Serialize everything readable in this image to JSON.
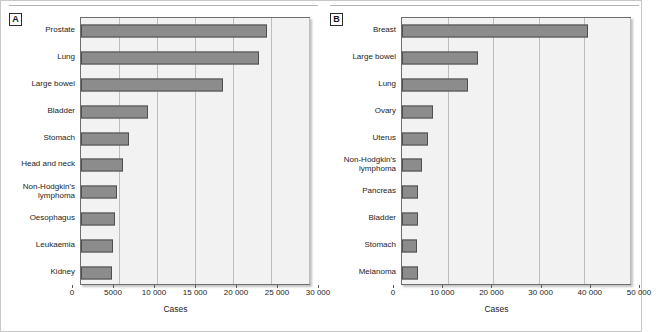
{
  "figure": {
    "background": "#ffffff",
    "bar_color": "#8c8c8c",
    "bar_edge_color": "#4f4f4f",
    "plot_background": "#f2f2f2",
    "gridline_color": "#bdbdbd"
  },
  "panels": [
    {
      "tag": "A",
      "axis_title": "Cases"
    },
    {
      "tag": "B",
      "axis_title": "Cases"
    }
  ],
  "chart_data": [
    {
      "type": "bar",
      "title": "A",
      "orientation": "horizontal",
      "xlabel": "Cases",
      "ylabel": "",
      "xlim": [
        0,
        30000
      ],
      "grid": true,
      "legend": "none",
      "xticks": [
        0,
        5000,
        10000,
        15000,
        20000,
        25000,
        30000
      ],
      "xticklabels": [
        "0",
        "5000",
        "10 000",
        "15 000",
        "20 000",
        "25 000",
        "30 000"
      ],
      "categories": [
        "Prostate",
        "Lung",
        "Large bowel",
        "Bladder",
        "Stomach",
        "Head and neck",
        "Non-Hodgkin's\nlymphoma",
        "Oesophagus",
        "Leukaemia",
        "Kidney"
      ],
      "values": [
        24500,
        23400,
        18700,
        8800,
        6300,
        5500,
        4800,
        4500,
        4200,
        4100
      ]
    },
    {
      "type": "bar",
      "title": "B",
      "orientation": "horizontal",
      "xlabel": "Cases",
      "ylabel": "",
      "xlim": [
        0,
        50000
      ],
      "grid": true,
      "legend": "none",
      "xticks": [
        0,
        10000,
        20000,
        30000,
        40000,
        50000
      ],
      "xticklabels": [
        "0",
        "10 000",
        "20 000",
        "30 000",
        "40 000",
        "50 000"
      ],
      "categories": [
        "Breast",
        "Large bowel",
        "Lung",
        "Ovary",
        "Uterus",
        "Non-Hodgkin's\nlymphoma",
        "Pancreas",
        "Bladder",
        "Stomach",
        "Melanoma"
      ],
      "values": [
        40800,
        16700,
        14400,
        6700,
        5600,
        4400,
        3500,
        3500,
        3300,
        3400
      ]
    }
  ]
}
